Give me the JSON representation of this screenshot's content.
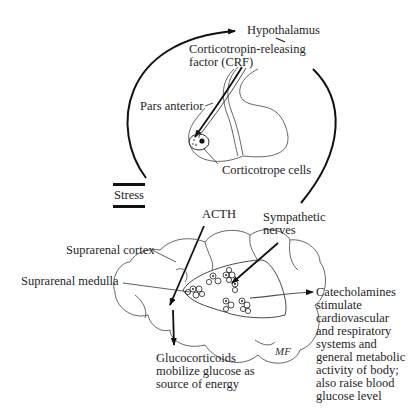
{
  "diagram": {
    "labels": {
      "hypothalamus": "Hypothalamus",
      "crf_line1": "Corticotropin-releasing",
      "crf_line2": "factor (CRF)",
      "pars_anterior": "Pars anterior",
      "corticotrope_cells": "Corticotrope cells",
      "stress": "Stress",
      "acth": "ACTH",
      "sympathetic_line1": "Sympathetic",
      "sympathetic_line2": "nerves",
      "suprarenal_cortex": "Suprarenal cortex",
      "suprarenal_medulla": "Suprarenal medulla",
      "catecholamines": [
        "Catecholamines",
        "stimulate",
        "cardiovascular",
        "and respiratory",
        "systems and",
        "general metabolic",
        "activity of body;",
        "also raise blood",
        "glucose level"
      ],
      "glucocorticoids": [
        "Glucocorticoids",
        "mobilize glucose as",
        "source of energy"
      ],
      "artist_signature": "MF"
    },
    "colors": {
      "line": "#1a1a1a",
      "outline": "#555555",
      "background": "#ffffff"
    }
  }
}
